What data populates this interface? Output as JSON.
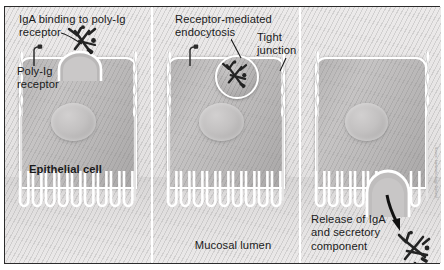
{
  "figure": {
    "type": "biological-process-diagram",
    "panel_count": 3,
    "style": "grayscale halftone textbook illustration"
  },
  "colors": {
    "frame_border": "#2b2b2b",
    "panel_background": "#e8e6e6",
    "cell_fill": "#bab8b8",
    "membrane_outline": "#ffffff",
    "nucleus_fill": "#c3c1c1",
    "text": "#1a1a1a",
    "arrow": "#111111"
  },
  "panels": [
    {
      "id": "panel-1",
      "step": 1,
      "labels": [
        {
          "name": "iga-binding-label",
          "text": "IgA binding to poly-Ig\nreceptor",
          "has_leader_line": true
        },
        {
          "name": "poly-ig-receptor-label",
          "text": "Poly-Ig\nreceptor",
          "has_leader_line": false
        },
        {
          "name": "epithelial-cell-label",
          "text": "Epithelial cell",
          "bold": true,
          "has_leader_line": false
        }
      ],
      "elements": [
        {
          "name": "free-poly-ig-receptor",
          "icon": "receptor-stalk-icon"
        },
        {
          "name": "iga-molecule-bound",
          "icon": "iga-antibody-icon"
        },
        {
          "name": "membrane-invagination",
          "icon": "invagination-pit-icon"
        },
        {
          "name": "nucleus",
          "icon": "nucleus-icon"
        },
        {
          "name": "microvilli",
          "icon": "microvilli-icon",
          "count": 9
        },
        {
          "name": "tight-junction-left",
          "icon": "tight-junction-icon"
        },
        {
          "name": "tight-junction-right",
          "icon": "tight-junction-icon"
        }
      ]
    },
    {
      "id": "panel-2",
      "step": 2,
      "labels": [
        {
          "name": "receptor-mediated-endocytosis-label",
          "text": "Receptor-mediated\nendocytosis",
          "has_leader_line": true
        },
        {
          "name": "tight-junction-label",
          "text": "Tight\njunction",
          "has_leader_line": true
        },
        {
          "name": "mucosal-lumen-label",
          "text": "Mucosal lumen",
          "has_leader_line": false
        }
      ],
      "elements": [
        {
          "name": "free-poly-ig-receptor",
          "icon": "receptor-stalk-icon"
        },
        {
          "name": "endocytic-vesicle",
          "icon": "vesicle-circle-icon"
        },
        {
          "name": "iga-molecule-in-vesicle",
          "icon": "iga-antibody-icon"
        },
        {
          "name": "nucleus",
          "icon": "nucleus-icon"
        },
        {
          "name": "microvilli",
          "icon": "microvilli-icon",
          "count": 9
        }
      ]
    },
    {
      "id": "panel-3",
      "step": 3,
      "labels": [
        {
          "name": "release-of-iga-label",
          "text": "Release of IgA\nand secretory\ncomponent",
          "has_leader_line": false
        }
      ],
      "elements": [
        {
          "name": "free-poly-ig-receptor",
          "icon": "receptor-stalk-icon"
        },
        {
          "name": "exocytosis-dome",
          "icon": "exocytosis-dome-icon"
        },
        {
          "name": "release-arrow",
          "icon": "curved-arrow-icon"
        },
        {
          "name": "secretory-iga-molecule",
          "icon": "iga-antibody-icon"
        },
        {
          "name": "nucleus",
          "icon": "nucleus-icon"
        },
        {
          "name": "microvilli",
          "icon": "microvilli-icon",
          "count": 9
        }
      ]
    }
  ],
  "flow_arrows": [
    {
      "name": "flow-arrow-1-to-2",
      "icon": "right-arrow-icon",
      "from": "panel-1",
      "to": "panel-2"
    },
    {
      "name": "flow-arrow-2-to-3",
      "icon": "right-arrow-icon",
      "from": "panel-2",
      "to": "panel-3"
    }
  ],
  "credit": "Source: Immunobiology, Garland"
}
